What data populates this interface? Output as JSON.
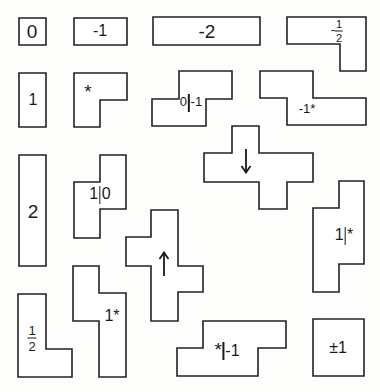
{
  "diagram": {
    "background": "#fdfdfb",
    "stroke_color": "#222222",
    "pieces": [
      {
        "id": "zero",
        "label": "0",
        "points": "19,18 46,18 46,45 19,45"
      },
      {
        "id": "neg-one",
        "label": "-1",
        "points": "74,18 127,18 127,45 74,45"
      },
      {
        "id": "neg-two",
        "label": "-2",
        "points": "153,17 260,17 260,45 153,45"
      },
      {
        "id": "neg-half",
        "label": "-½",
        "points": "287,17 366,17 366,71 340,71 340,44 287,44"
      },
      {
        "id": "one",
        "label": "1",
        "points": "19,73 46,73 46,127 19,127"
      },
      {
        "id": "star",
        "label": "*",
        "points": "74,73 127,73 127,100 100,100 100,127 74,127"
      },
      {
        "id": "zero-neg-one",
        "label": "0|-1",
        "points": "179,71 232,71 232,99 206,99 206,126 152,126 152,99 179,99"
      },
      {
        "id": "neg-one-star",
        "label": "-1*",
        "points": "260,71 313,71 313,98 366,98 366,125 287,125 287,98 260,98"
      },
      {
        "id": "two",
        "label": "2",
        "points": "19,155 46,155 46,266 19,266"
      },
      {
        "id": "one-zero",
        "label": "1|0",
        "points": "100,155 126,155 126,209 100,209 100,238 74,238 74,182 100,182"
      },
      {
        "id": "down",
        "label": "↓",
        "points": "232,126 259,126 259,153 313,153 313,182 287,182 287,209 259,209 259,182 204,182 204,153 232,153"
      },
      {
        "id": "one-star-bar",
        "label": "1|*",
        "points": "339,181 364,181 364,264 339,264 339,292 313,292 313,208 339,208"
      },
      {
        "id": "up",
        "label": "↑",
        "points": "151,210 178,210 178,266 203,266 203,292 178,292 178,321 151,321 151,266 126,266 126,237 151,237"
      },
      {
        "id": "half",
        "label": "½",
        "points": "18,294 46,294 46,349 72,349 72,377 18,377"
      },
      {
        "id": "one-star",
        "label": "1*",
        "points": "73,266 99,266 99,293 126,293 126,377 99,377 99,321 73,321"
      },
      {
        "id": "star-neg-one",
        "label": "*|-1",
        "points": "203,321 286,321 286,348 258,348 258,376 177,376 177,348 203,348"
      },
      {
        "id": "plus-minus-one",
        "label": "±1",
        "points": "313,319 364,319 364,376 313,376"
      }
    ],
    "labels": {
      "zero": "0",
      "neg_one": "-1",
      "neg_two": "-2",
      "neg_half_sign": "-",
      "neg_half_num": "1",
      "neg_half_den": "2",
      "one": "1",
      "star": "*",
      "zero_neg_one_left": "0",
      "zero_neg_one_right": "-1",
      "neg_one_star": "-1*",
      "two": "2",
      "one_zero_left": "1",
      "one_zero_right": "0",
      "one_star_bar_left": "1",
      "one_star_bar_right": "*",
      "half_num": "1",
      "half_den": "2",
      "one_star": "1*",
      "star_neg_one_left": "*",
      "star_neg_one_right": "-1",
      "plus_minus_one": "±1",
      "down_arrow": "down",
      "up_arrow": "up"
    }
  }
}
